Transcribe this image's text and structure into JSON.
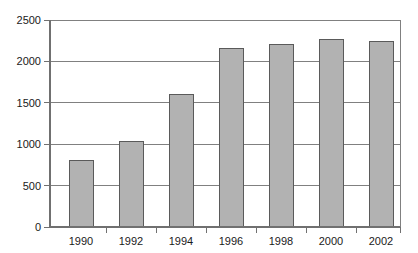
{
  "chart_data": {
    "type": "bar",
    "title": "",
    "subtitle": "",
    "xlabel": "",
    "ylabel": "",
    "categories": [
      "1990",
      "1992",
      "1994",
      "1996",
      "1998",
      "2000",
      "2002"
    ],
    "values": [
      800,
      1030,
      1600,
      2150,
      2200,
      2260,
      2245
    ],
    "series": [
      {
        "name": "",
        "values": [
          800,
          1030,
          1600,
          2150,
          2200,
          2260,
          2245
        ]
      }
    ],
    "ylim": [
      0,
      2500
    ],
    "ytick_labels": [
      "0",
      "500",
      "1000",
      "1500",
      "2000",
      "2500"
    ],
    "ytick_values": [
      0,
      500,
      1000,
      1500,
      2000,
      2500
    ],
    "xtick_labels": [
      "1990",
      "1992",
      "1994",
      "1996",
      "1998",
      "2000",
      "2002"
    ],
    "grid": true,
    "grid_axis": "y",
    "legend": false,
    "legend_position": "none",
    "annotations": [],
    "colors": {
      "bar_fill": "#b2b2b2",
      "bar_stroke": "#5a5a5a",
      "gridline": "#808080",
      "axis": "#707070",
      "background": "#ffffff",
      "text": "#1a1a1a"
    }
  }
}
